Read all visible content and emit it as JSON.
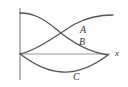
{
  "figure": {
    "background_color": "#fdfdfd",
    "stroke_color": "#555555",
    "axis_color": "#9a9a9a",
    "label_color": "#3a3a3a",
    "origin": {
      "x": 20,
      "y": 54
    }
  },
  "axes": {
    "vertical": {
      "name": "vertical-axis",
      "x": 20,
      "y_top": 8,
      "y_bottom": 80,
      "color": "#a8a8a8",
      "width": 1.6
    },
    "horizontal": {
      "name": "x-axis",
      "label": "x",
      "label_x": 115,
      "label_y": 56,
      "x_start": 20,
      "x_end": 110,
      "y": 54,
      "color": "#9a9a9a",
      "width": 1
    }
  },
  "curves": [
    {
      "id": "curve-a",
      "label": "A",
      "label_x": 80,
      "label_y": 33,
      "description": "rises from origin, concave down, flattens toward upper right",
      "path": "M 20,54 C 38,50 58,34 75,24 C 88,17 100,15 113,15",
      "color": "#555555",
      "width": 1.3
    },
    {
      "id": "curve-b",
      "label": "B",
      "label_x": 79,
      "label_y": 45,
      "description": "descends from top left of vertical axis, concave down, meets x-axis at right",
      "path": "M 20,13 C 34,13 44,19 56,29 C 70,41 88,52 108,55",
      "color": "#555555",
      "width": 1.3
    },
    {
      "id": "curve-c",
      "label": "C",
      "label_x": 73,
      "label_y": 80,
      "description": "dips from origin below x-axis, minimum near x=62, returns to x-axis at right",
      "path": "M 20,54 C 34,64 46,71 62,72 C 80,73 96,64 108,55",
      "color": "#555555",
      "width": 1.3
    }
  ]
}
